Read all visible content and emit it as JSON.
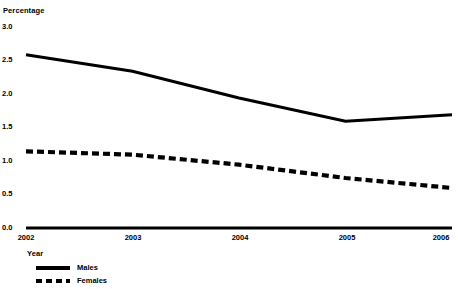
{
  "chart_data": {
    "type": "line",
    "title": "",
    "ylabel": "Percentage",
    "xlabel": "Year",
    "categories": [
      "2002",
      "2003",
      "2004",
      "2005",
      "2006"
    ],
    "x": [
      2002,
      2003,
      2004,
      2005,
      2006
    ],
    "series": [
      {
        "name": "Males",
        "values": [
          2.6,
          2.35,
          1.95,
          1.6,
          1.7
        ],
        "style": "solid"
      },
      {
        "name": "Females",
        "values": [
          1.15,
          1.1,
          0.95,
          0.75,
          0.6
        ],
        "style": "dashed"
      }
    ],
    "ylim": [
      0.0,
      3.0
    ],
    "yticks": [
      "0.0",
      "0.5",
      "1.0",
      "1.5",
      "2.0",
      "2.5",
      "3.0"
    ],
    "ytick_values": [
      0.0,
      0.5,
      1.0,
      1.5,
      2.0,
      2.5,
      3.0
    ],
    "xlim": [
      2002,
      2006
    ],
    "grid": false,
    "legend_position": "bottom-left",
    "line_color": "#000000"
  },
  "axes": {
    "y_title": "Percentage",
    "x_title": "Year"
  },
  "legend": {
    "items": [
      {
        "label": "Males",
        "style": "solid"
      },
      {
        "label": "Females",
        "style": "dashed"
      }
    ]
  }
}
